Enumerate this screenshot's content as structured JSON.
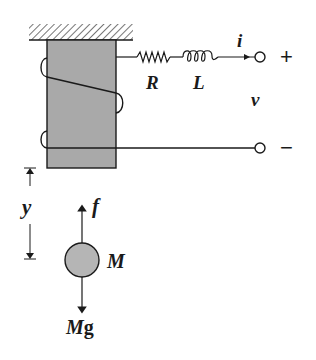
{
  "diagram": {
    "type": "electromechanical-schematic",
    "colors": {
      "line": "#1a1a1a",
      "core_fill": "#a9a9a9",
      "mass_fill": "#b5b5b5",
      "background": "#ffffff"
    },
    "labels": {
      "resistor": "R",
      "inductor": "L",
      "current": "i",
      "voltage": "v",
      "plus_terminal": "+",
      "minus_terminal": "−",
      "displacement": "y",
      "magnetic_force": "f",
      "mass": "M",
      "gravity_force_M": "M",
      "gravity_force_g": "g"
    },
    "components": [
      {
        "id": "ground-support",
        "kind": "fixed-support-hatch"
      },
      {
        "id": "core",
        "kind": "ferromagnetic-core"
      },
      {
        "id": "coil",
        "kind": "winding"
      },
      {
        "id": "resistor",
        "kind": "resistor",
        "label": "R"
      },
      {
        "id": "inductor",
        "kind": "inductor",
        "label": "L"
      },
      {
        "id": "terminal-plus",
        "kind": "terminal",
        "label": "+"
      },
      {
        "id": "terminal-minus",
        "kind": "terminal",
        "label": "−"
      },
      {
        "id": "ball",
        "kind": "mass",
        "label": "M"
      }
    ]
  }
}
